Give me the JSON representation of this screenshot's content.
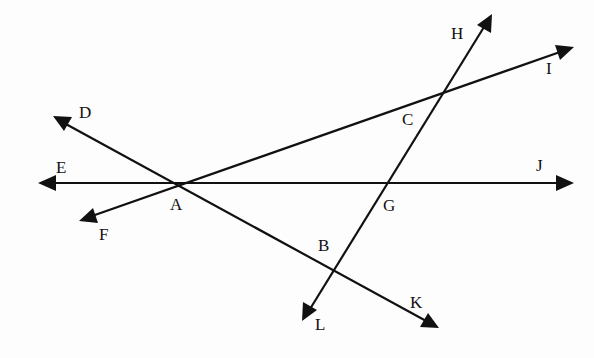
{
  "diagram": {
    "type": "intersecting-lines",
    "colors": {
      "line": "#111111",
      "background": "#fdfdfd"
    },
    "lines": [
      {
        "id": "EJ",
        "from": [
          38,
          183
        ],
        "to": [
          572,
          183
        ],
        "arrows": [
          "E",
          "J"
        ]
      },
      {
        "id": "DK",
        "from": [
          54,
          117
        ],
        "to": [
          437,
          327
        ],
        "arrows": [
          "D",
          "K"
        ]
      },
      {
        "id": "FI",
        "from": [
          80,
          220
        ],
        "to": [
          572,
          48
        ],
        "arrows": [
          "F",
          "I"
        ]
      },
      {
        "id": "HL",
        "from": [
          491,
          15
        ],
        "to": [
          303,
          320
        ],
        "arrows": [
          "H",
          "L"
        ]
      }
    ],
    "points": {
      "A": {
        "text": "A",
        "x": 170,
        "y": 210
      },
      "B": {
        "text": "B",
        "x": 318,
        "y": 250
      },
      "C": {
        "text": "C",
        "x": 402,
        "y": 124
      },
      "D": {
        "text": "D",
        "x": 79,
        "y": 118
      },
      "E": {
        "text": "E",
        "x": 56,
        "y": 173
      },
      "F": {
        "text": "F",
        "x": 99,
        "y": 240
      },
      "G": {
        "text": "G",
        "x": 383,
        "y": 211
      },
      "H": {
        "text": "H",
        "x": 451,
        "y": 40
      },
      "I": {
        "text": "I",
        "x": 544,
        "y": 74
      },
      "J": {
        "text": "J",
        "x": 536,
        "y": 171
      },
      "K": {
        "text": "K",
        "x": 410,
        "y": 308
      },
      "L": {
        "text": "L",
        "x": 315,
        "y": 328
      }
    }
  }
}
